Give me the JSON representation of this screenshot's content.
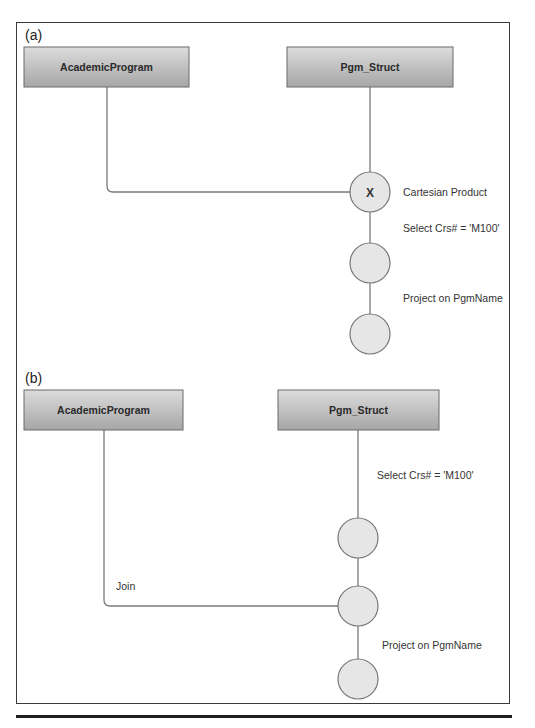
{
  "panels": [
    {
      "id": "a",
      "label": "(a)",
      "tables": [
        "AcademicProgram",
        "Pgm_Struct"
      ],
      "operations": [
        {
          "symbol": "X",
          "label": "Cartesian Product"
        },
        {
          "symbol": "",
          "label": ""
        },
        {
          "symbol": "",
          "label": ""
        }
      ],
      "edge_labels": [
        "Select Crs# = 'M100'",
        "Project on PgmName"
      ]
    },
    {
      "id": "b",
      "label": "(b)",
      "tables": [
        "AcademicProgram",
        "Pgm_Struct"
      ],
      "operations": [
        {
          "symbol": "",
          "label": ""
        },
        {
          "symbol": "",
          "label": ""
        },
        {
          "symbol": "",
          "label": ""
        }
      ],
      "edge_labels": [
        "Select Crs# = 'M100'",
        "Join",
        "Project on PgmName"
      ]
    }
  ],
  "colors": {
    "box_top": "#d8d8d8",
    "box_bottom": "#a8a8a8",
    "circle_fill": "#e6e6e6",
    "edge": "#7a7a7a",
    "frame": "#3a3a3a"
  }
}
